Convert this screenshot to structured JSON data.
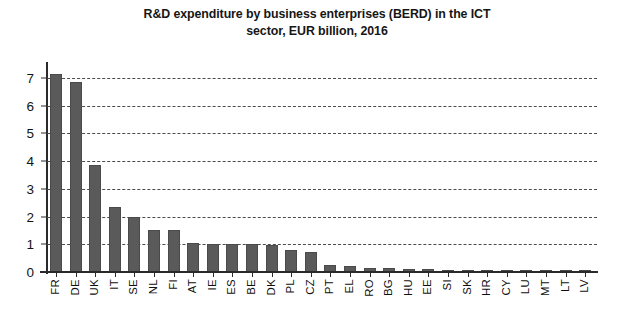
{
  "chart_data": {
    "type": "bar",
    "title": "R&D expenditure by business enterprises (BERD) in the ICT sector, EUR billion, 2016",
    "title_line1": "R&D expenditure by business enterprises (BERD) in the ICT",
    "title_line2": "sector, EUR billion, 2016",
    "xlabel": "",
    "ylabel": "",
    "ylim": [
      0,
      7.4
    ],
    "y_ticks": [
      0,
      1,
      2,
      3,
      4,
      5,
      6,
      7
    ],
    "y_tick_labels": [
      "0",
      "1",
      "2",
      "3",
      "4",
      "5",
      "6",
      "7"
    ],
    "grid": true,
    "grid_orientation": "horizontal",
    "grid_style": "dashed",
    "legend": false,
    "bar_color": "#5a5a5a",
    "categories": [
      "FR",
      "DE",
      "UK",
      "IT",
      "SE",
      "NL",
      "FI",
      "AT",
      "IE",
      "ES",
      "BE",
      "DK",
      "PL",
      "CZ",
      "PT",
      "EL",
      "RO",
      "BG",
      "HU",
      "EE",
      "SI",
      "SK",
      "HR",
      "CY",
      "LU",
      "MT",
      "LT",
      "LV"
    ],
    "values": [
      7.15,
      6.85,
      3.85,
      2.35,
      2.0,
      1.5,
      1.5,
      1.05,
      1.0,
      1.0,
      1.0,
      0.98,
      0.78,
      0.72,
      0.25,
      0.2,
      0.15,
      0.13,
      0.12,
      0.1,
      0.09,
      0.08,
      0.07,
      0.06,
      0.05,
      0.04,
      0.03,
      0.02
    ]
  }
}
